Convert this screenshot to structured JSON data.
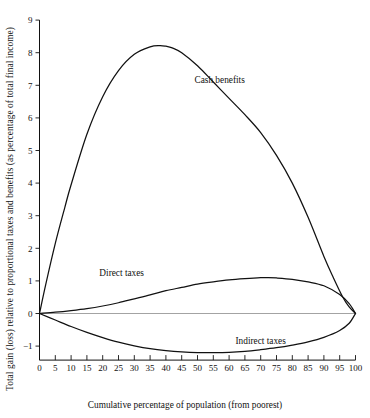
{
  "chart_data": {
    "type": "line",
    "title": "",
    "xlabel": "Cumulative percentage of population (from poorest)",
    "ylabel": "Total gain (loss) relative to proportional taxes and benefits (as percentage of total final income)",
    "xlim": [
      0,
      100
    ],
    "ylim": [
      -1.6,
      9.3
    ],
    "grid": false,
    "legend": "inline-annotations",
    "xticks": [
      0,
      5,
      10,
      15,
      20,
      25,
      30,
      35,
      40,
      45,
      50,
      55,
      60,
      65,
      70,
      75,
      80,
      85,
      90,
      95,
      100
    ],
    "xtick_labels": [
      "0",
      "5",
      "10",
      "15",
      "20",
      "25",
      "30",
      "35",
      "40",
      "45",
      "50",
      "55",
      "60",
      "65",
      "70",
      "75",
      "80",
      "85",
      "90",
      "95",
      "100"
    ],
    "yticks": [
      -1,
      0,
      1,
      2,
      3,
      4,
      5,
      6,
      7,
      8,
      9
    ],
    "ytick_labels": [
      "−1",
      "0",
      "1",
      "2",
      "3",
      "4",
      "5",
      "6",
      "7",
      "8",
      "9"
    ],
    "zero_reference_line": true,
    "series": [
      {
        "name": "Cash benefits",
        "label": "Cash benefits",
        "annotation_x": 57,
        "annotation_y": 7.15,
        "x": [
          0,
          2,
          5,
          8,
          10,
          15,
          20,
          25,
          30,
          35,
          38,
          40,
          42,
          45,
          50,
          55,
          60,
          65,
          70,
          75,
          80,
          85,
          90,
          93,
          96,
          98,
          100
        ],
        "y": [
          0.0,
          0.9,
          2.15,
          3.25,
          3.95,
          5.5,
          6.65,
          7.45,
          7.95,
          8.18,
          8.22,
          8.2,
          8.15,
          8.0,
          7.6,
          7.1,
          6.6,
          6.1,
          5.55,
          4.85,
          4.0,
          2.95,
          1.75,
          1.1,
          0.5,
          0.2,
          0.0
        ]
      },
      {
        "name": "Direct taxes",
        "label": "Direct taxes",
        "annotation_x": 26,
        "annotation_y": 1.25,
        "x": [
          0,
          5,
          10,
          15,
          20,
          25,
          30,
          35,
          40,
          45,
          50,
          55,
          60,
          65,
          70,
          72,
          75,
          80,
          85,
          90,
          95,
          98,
          100
        ],
        "y": [
          0.0,
          0.04,
          0.09,
          0.15,
          0.23,
          0.33,
          0.45,
          0.57,
          0.7,
          0.8,
          0.9,
          0.97,
          1.03,
          1.07,
          1.1,
          1.1,
          1.09,
          1.05,
          0.97,
          0.85,
          0.58,
          0.3,
          0.0
        ]
      },
      {
        "name": "Indirect taxes",
        "label": "Indirect taxes",
        "annotation_x": 70,
        "annotation_y": -0.85,
        "x": [
          0,
          5,
          10,
          15,
          20,
          25,
          30,
          35,
          40,
          45,
          50,
          55,
          60,
          65,
          70,
          75,
          80,
          85,
          90,
          95,
          98,
          100
        ],
        "y": [
          0.0,
          -0.2,
          -0.4,
          -0.58,
          -0.74,
          -0.88,
          -0.99,
          -1.08,
          -1.14,
          -1.18,
          -1.2,
          -1.2,
          -1.19,
          -1.16,
          -1.11,
          -1.05,
          -0.97,
          -0.87,
          -0.73,
          -0.52,
          -0.3,
          0.0
        ]
      }
    ]
  },
  "axes": {
    "x_title": "Cumulative percentage of population (from poorest)",
    "y_title": "Total gain (loss) relative to proportional taxes and benefits (as percentage of total final income)"
  },
  "annotations": {
    "cash_benefits": "Cash benefits",
    "direct_taxes": "Direct taxes",
    "indirect_taxes": "Indirect taxes"
  },
  "colors": {
    "curve": "#111111",
    "axis": "#111111",
    "zero_line": "#8c8c8c",
    "background": "#ffffff"
  }
}
